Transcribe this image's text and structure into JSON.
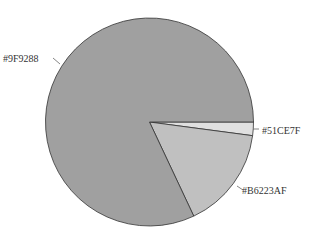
{
  "chart_data": {
    "type": "pie",
    "title": "",
    "categories": [
      "#9F9288",
      "#B6223AF",
      "#51CE7F"
    ],
    "values": [
      82.0,
      15.9,
      2.1
    ],
    "slice_fills": [
      "#a0a0a0",
      "#c0c0c0",
      "#e0e0e0"
    ],
    "start_angle_deg": 0,
    "direction": "clockwise_from_3_oclock_for_small_slices",
    "legend": null
  },
  "labels": {
    "slice_0": "#9F9288",
    "slice_1": "#B6223AF",
    "slice_2": "#51CE7F"
  }
}
